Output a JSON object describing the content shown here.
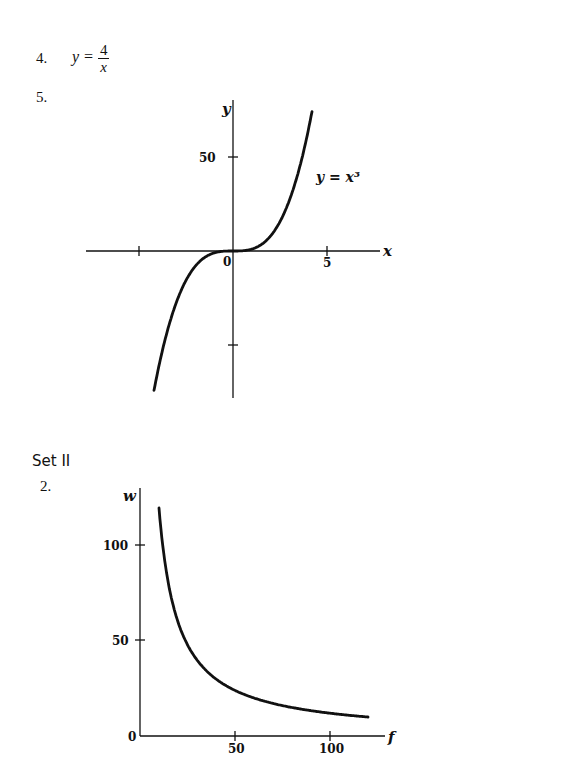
{
  "problems": {
    "p4": {
      "number": "4.",
      "lhs": "y =",
      "numerator": "4",
      "denominator": "x"
    },
    "p5": {
      "number": "5."
    }
  },
  "set_heading": "Set II",
  "set2": {
    "p2": {
      "number": "2."
    }
  },
  "chart_data": [
    {
      "type": "line",
      "title": "",
      "curve_label": "y = x³",
      "xlabel": "x",
      "ylabel": "y",
      "x_ticks": [
        -5,
        5
      ],
      "x_tick_labels": [
        "",
        "5"
      ],
      "y_ticks": [
        50,
        -50
      ],
      "y_tick_labels": [
        "50",
        ""
      ],
      "origin_label": "0",
      "xlim": [
        -8,
        8
      ],
      "ylim": [
        -80,
        80
      ],
      "grid": false,
      "legend": "none",
      "series": [
        {
          "name": "y = x^3",
          "x": [
            -4.2,
            -4,
            -3.5,
            -3,
            -2.5,
            -2,
            -1.5,
            -1,
            -0.5,
            0,
            0.5,
            1,
            1.5,
            2,
            2.5,
            3,
            3.5,
            4,
            4.2
          ],
          "y": [
            -74.1,
            -64,
            -42.9,
            -27,
            -15.6,
            -8,
            -3.4,
            -1,
            -0.1,
            0,
            0.1,
            1,
            3.4,
            8,
            15.6,
            27,
            42.9,
            64,
            74.1
          ]
        }
      ]
    },
    {
      "type": "line",
      "title": "",
      "xlabel": "f",
      "ylabel": "w",
      "x_ticks": [
        50,
        100
      ],
      "x_tick_labels": [
        "50",
        "100"
      ],
      "y_ticks": [
        50,
        100
      ],
      "y_tick_labels": [
        "50",
        "100"
      ],
      "origin_label": "0",
      "xlim": [
        0,
        125
      ],
      "ylim": [
        0,
        125
      ],
      "grid": false,
      "legend": "none",
      "series": [
        {
          "name": "w = 1200/f",
          "x": [
            10,
            12,
            15,
            20,
            25,
            30,
            40,
            50,
            60,
            70,
            80,
            90,
            100,
            110,
            120
          ],
          "y": [
            120,
            100,
            80,
            60,
            48,
            40,
            30,
            24,
            20,
            17.1,
            15,
            13.3,
            12,
            10.9,
            10
          ]
        }
      ]
    }
  ]
}
